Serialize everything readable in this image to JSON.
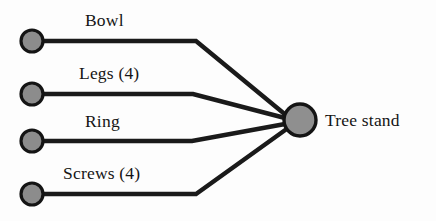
{
  "diagram": {
    "type": "convergence-assembly-diagram",
    "background_color": "#fdfdfd",
    "node_fill_color": "#8c8c8c",
    "node_stroke_color": "#141414",
    "edge_color": "#1a1a1a",
    "text_color": "#151515",
    "components": [
      {
        "id": "bowl",
        "label": "Bowl",
        "node_x": 32,
        "node_y": 41,
        "node_radius": 11,
        "label_x": 85,
        "label_y": 10
      },
      {
        "id": "legs",
        "label": "Legs (4)",
        "node_x": 32,
        "node_y": 94,
        "node_radius": 11,
        "label_x": 79,
        "label_y": 63
      },
      {
        "id": "ring",
        "label": "Ring",
        "node_x": 32,
        "node_y": 141,
        "node_radius": 11,
        "label_x": 85,
        "label_y": 111
      },
      {
        "id": "screws",
        "label": "Screws (4)",
        "node_x": 32,
        "node_y": 194,
        "node_radius": 11,
        "label_x": 63,
        "label_y": 163
      }
    ],
    "assembly": {
      "id": "tree-stand",
      "label": "Tree stand",
      "node_x": 300,
      "node_y": 120,
      "node_radius": 16,
      "label_x": 325,
      "label_y": 110
    },
    "edges": [
      {
        "id": "edge-bowl",
        "from": "bowl",
        "to": "tree-stand",
        "path": "M 43 41 L 196 41 L 287 116"
      },
      {
        "id": "edge-legs",
        "from": "legs",
        "to": "tree-stand",
        "path": "M 43 94 L 193 94 L 285 118"
      },
      {
        "id": "edge-ring",
        "from": "ring",
        "to": "tree-stand",
        "path": "M 43 141 L 192 141 L 285 124"
      },
      {
        "id": "edge-screws",
        "from": "screws",
        "to": "tree-stand",
        "path": "M 43 194 L 196 194 L 288 128"
      }
    ]
  }
}
